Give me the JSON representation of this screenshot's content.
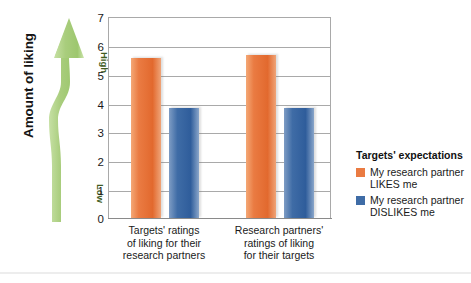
{
  "axis_title": "Amount of liking",
  "arrow": {
    "high_label": "High",
    "low_label": "Low",
    "color": "#a8cb7f"
  },
  "legend": {
    "title": "Targets' expectations",
    "items": [
      {
        "label": "My research partner LIKES me",
        "color": "#ea7b42"
      },
      {
        "label": "My research partner DISLIKES me",
        "color": "#3f6ca6"
      }
    ]
  },
  "yticks": [
    "7",
    "6",
    "5",
    "4",
    "3",
    "2",
    "1",
    "0"
  ],
  "chart_data": {
    "type": "bar",
    "title": "",
    "xlabel": "",
    "ylabel": "Amount of liking",
    "ylim": [
      0,
      7
    ],
    "yticks": [
      0,
      1,
      2,
      3,
      4,
      5,
      6,
      7
    ],
    "grid": true,
    "legend_position": "right",
    "legend_title": "Targets' expectations",
    "categories": [
      "Targets' ratings of liking for their research partners",
      "Research partners' ratings of liking for their targets"
    ],
    "category_lines": [
      [
        "Targets' ratings",
        "of liking for their",
        "research partners"
      ],
      [
        "Research partners'",
        "ratings of liking",
        "for their targets"
      ]
    ],
    "series": [
      {
        "name": "My research partner LIKES me",
        "color": "#ea7b42",
        "values": [
          5.6,
          5.7
        ]
      },
      {
        "name": "My research partner DISLIKES me",
        "color": "#3f6ca6",
        "values": [
          3.85,
          3.85
        ]
      }
    ]
  }
}
